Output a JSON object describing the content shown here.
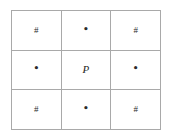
{
  "figure": {
    "name": "three-by-three-point-grid",
    "rows": 3,
    "columns": 3,
    "background_color": "#ffffff",
    "border_color": "#a9a9a9",
    "glyph_color": "#2b2b2b"
  },
  "legend": {
    "hash_symbol": "#",
    "dot_symbol": "•",
    "center_label": "P"
  },
  "cells": [
    [
      {
        "id": "cell-r1c1",
        "text": "#",
        "kind": "hash"
      },
      {
        "id": "cell-r1c2",
        "text": "•",
        "kind": "dot"
      },
      {
        "id": "cell-r1c3",
        "text": "#",
        "kind": "hash"
      }
    ],
    [
      {
        "id": "cell-r2c1",
        "text": "•",
        "kind": "dot"
      },
      {
        "id": "cell-r2c2",
        "text": "P",
        "kind": "label"
      },
      {
        "id": "cell-r2c3",
        "text": "•",
        "kind": "dot"
      }
    ],
    [
      {
        "id": "cell-r3c1",
        "text": "#",
        "kind": "hash"
      },
      {
        "id": "cell-r3c2",
        "text": "•",
        "kind": "dot"
      },
      {
        "id": "cell-r3c3",
        "text": "#",
        "kind": "hash"
      }
    ]
  ]
}
